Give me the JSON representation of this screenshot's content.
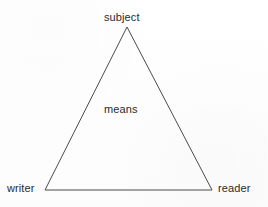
{
  "diagram": {
    "type": "triangle",
    "background_color": "#fdfdfd",
    "stroke_color": "#4a4a4a",
    "stroke_width": 1,
    "text_color": "#2b2b2b",
    "vertices": [
      {
        "id": "apex",
        "label": "subject",
        "x": 127,
        "y": 27
      },
      {
        "id": "bottom-left",
        "label": "writer",
        "x": 45,
        "y": 190
      },
      {
        "id": "bottom-right",
        "label": "reader",
        "x": 212,
        "y": 190
      }
    ],
    "interior_label": "means",
    "labels": {
      "subject": "subject",
      "writer": "writer",
      "reader": "reader",
      "means": "means"
    }
  }
}
